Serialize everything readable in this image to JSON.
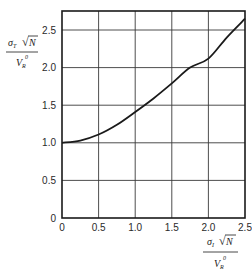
{
  "chart_data": {
    "type": "line",
    "title": "",
    "xlabel": "σ_I √N / V_R⁰",
    "ylabel": "σ_T √N / V_R⁰",
    "xlim": [
      0,
      2.5
    ],
    "ylim": [
      0,
      2.75
    ],
    "grid": true,
    "legend": null,
    "x_ticks": [
      "0",
      "0.5",
      "1.0",
      "1.5",
      "2.0",
      "2.5"
    ],
    "y_ticks": [
      "0",
      "0.5",
      "1.0",
      "1.5",
      "2.0",
      "2.5"
    ],
    "series": [
      {
        "name": "curve",
        "x": [
          0,
          0.25,
          0.5,
          0.75,
          1.0,
          1.25,
          1.5,
          1.75,
          2.0,
          2.25,
          2.5
        ],
        "y": [
          1.0,
          1.03,
          1.11,
          1.24,
          1.41,
          1.59,
          1.79,
          2.0,
          2.12,
          2.4,
          2.65
        ]
      }
    ],
    "colors": {
      "line": "#1a1a1a",
      "grid": "#3a3a3a",
      "background": "#ffffff"
    }
  },
  "axes": {
    "y_label": {
      "sigma": "σ",
      "sub": "T",
      "root": "√",
      "var": "N",
      "den": "V",
      "den_sub": "R",
      "den_sup": "0"
    },
    "x_label": {
      "sigma": "σ",
      "sub": "I",
      "root": "√",
      "var": "N",
      "den": "V",
      "den_sub": "R",
      "den_sup": "0"
    }
  }
}
